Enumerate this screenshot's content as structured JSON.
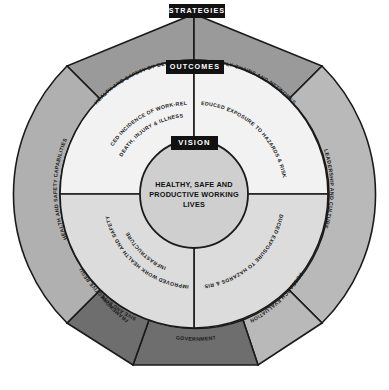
{
  "diagram": {
    "levels": {
      "strategies": "STRATEGIES",
      "outcomes": "OUTCOMES",
      "vision": "VISION"
    },
    "vision_statement": {
      "line1": "HEALTHY, SAFE AND",
      "line2": "PRODUCTIVE WORKING",
      "line3": "LIVES"
    },
    "outcomes_ring": [
      {
        "id": "outcome-top-left",
        "label": "REDUCED INCIDENCE OF WORK-RELATED",
        "label_line2": "DEATH, INJURY & ILLNESS",
        "color": "#f2f2f2"
      },
      {
        "id": "outcome-top-right",
        "label": "REDUCED EXPOSURE TO HAZARDS & RISKS",
        "label_line2": "",
        "color": "#f2f2f2"
      },
      {
        "id": "outcome-bottom-right",
        "label": "REDUCED EXPOSURE TO HAZARDS & RISKS",
        "label_line2": "",
        "color": "#dcdcdc"
      },
      {
        "id": "outcome-bottom-left",
        "label": "IMPROVED WORK HEALTH AND SAFETY",
        "label_line2": "INFRASTRUCTURE",
        "color": "#dcdcdc"
      }
    ],
    "strategies_ring": [
      {
        "id": "strategy-health-safety-by-design",
        "label": "HEALTH AND SAFETY BY DESIGN",
        "color": "#9a9a9a"
      },
      {
        "id": "strategy-supply-chains-networks",
        "label": "SUPPLY CHAINS AND NETWORKS",
        "color": "#9a9a9a"
      },
      {
        "id": "strategy-leadership-culture",
        "label": "LEADERSHIP AND CULTURE",
        "color": "#b9b9b9"
      },
      {
        "id": "strategy-research-evaluation",
        "label": "RESEARCH EVALUATION",
        "color": "#b9b9b9"
      },
      {
        "id": "strategy-government",
        "label": "GOVERNMENT",
        "color": "#6e6e6e"
      },
      {
        "id": "strategy-regulatory-framework",
        "label": "RESPONSIVE AND EFFECTIVE REGULATORY",
        "label_line2": "FRAMEWORK",
        "color": "#6e6e6e"
      },
      {
        "id": "strategy-health-safety-capabilities",
        "label": "HEALTH AND SAFETY CAPABILITIES",
        "color": "#b0b0b0"
      }
    ],
    "colors": {
      "background": "#ffffff",
      "outline": "#1a1a1a",
      "tag_background": "#111111",
      "tag_text": "#ffffff",
      "core_fill": "#cfcfcf",
      "ring_light": "#f2f2f2",
      "ring_grey": "#dcdcdc",
      "outer_light": "#b9b9b9",
      "outer_mid": "#9a9a9a",
      "outer_dark": "#6e6e6e"
    }
  }
}
